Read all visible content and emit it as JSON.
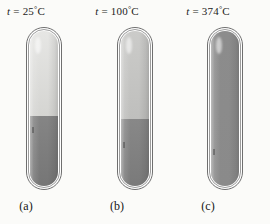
{
  "figure": {
    "background_color": "#fbfbf9",
    "caption_color": "#1b1b1b"
  },
  "panels": [
    {
      "id": "a",
      "panel_label": "(a)",
      "temp_variable": "t",
      "temp_equals": "=",
      "temp_value": "25",
      "temp_degree": "°",
      "temp_unit": "C",
      "temp_label_full": "t = 25°C",
      "left_px": 26,
      "vapor_color": "#e6e6e4",
      "vapor_color_bottom": "#d5d5d2",
      "liquid_color": "#858585",
      "liquid_color_bottom": "#767676",
      "liquid_fraction_percent": 45,
      "state": "liquid and vapor, sharp meniscus"
    },
    {
      "id": "b",
      "panel_label": "(b)",
      "temp_variable": "t",
      "temp_equals": "=",
      "temp_value": "100",
      "temp_degree": "°",
      "temp_unit": "C",
      "temp_label_full": "t = 100°C",
      "left_px": 117,
      "vapor_color": "#cbcbc9",
      "vapor_color_bottom": "#bfbfbd",
      "liquid_color": "#888888",
      "liquid_color_bottom": "#7a7a7a",
      "liquid_fraction_percent": 43,
      "state": "liquid and denser vapor, meniscus still visible"
    },
    {
      "id": "c",
      "panel_label": "(c)",
      "temp_variable": "t",
      "temp_equals": "=",
      "temp_value": "374",
      "temp_degree": "°",
      "temp_unit": "C",
      "temp_label_full": "t = 374°C",
      "left_px": 207,
      "vapor_color": "#8c8c8c",
      "vapor_color_bottom": "#8c8c8c",
      "liquid_color": "#8c8c8c",
      "liquid_color_bottom": "#8a8a8a",
      "liquid_fraction_percent": 100,
      "state": "critical point, single uniform fluid phase"
    }
  ]
}
